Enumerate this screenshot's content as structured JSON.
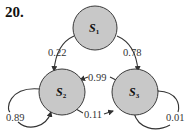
{
  "problem_number": "20.",
  "states": [
    {
      "id": "S1",
      "label": "S",
      "subscript": "1"
    },
    {
      "id": "S2",
      "label": "S",
      "subscript": "2"
    },
    {
      "id": "S3",
      "label": "S",
      "subscript": "3"
    }
  ],
  "transitions": [
    {
      "from": "S1",
      "to": "S2",
      "probability": "0.22"
    },
    {
      "from": "S1",
      "to": "S3",
      "probability": "0.78"
    },
    {
      "from": "S3",
      "to": "S2",
      "probability": "0.99"
    },
    {
      "from": "S2",
      "to": "S3",
      "probability": "0.11"
    },
    {
      "from": "S2",
      "to": "S2",
      "probability": "0.89"
    },
    {
      "from": "S3",
      "to": "S3",
      "probability": "0.01"
    }
  ],
  "colors": {
    "node_fill": "#c8c8c8",
    "node_stroke": "#3a3a3a",
    "edge": "#333333"
  }
}
